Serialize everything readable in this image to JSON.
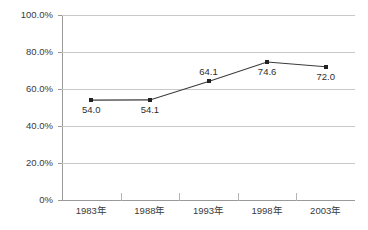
{
  "chart_data": {
    "type": "line",
    "title": "",
    "subtitle": "",
    "xlabel": "",
    "ylabel": "",
    "categories": [
      "1983年",
      "1988年",
      "1993年",
      "1998年",
      "2003年"
    ],
    "values": [
      54.0,
      54.1,
      64.1,
      74.6,
      72.0
    ],
    "value_labels": [
      "54.0",
      "54.1",
      "64.1",
      "74.6",
      "72.0"
    ],
    "label_positions": [
      "below",
      "below",
      "above",
      "below",
      "below"
    ],
    "ylim": [
      0,
      100
    ],
    "ytick_values": [
      100,
      80,
      60,
      40,
      20,
      0
    ],
    "ytick_labels": [
      "100.0%",
      "80.0%",
      "60.0%",
      "40.0%",
      "20.0%",
      "0%"
    ],
    "grid": true,
    "legend": "none",
    "series_color": "#3b3b3b",
    "marker_color": "#222222",
    "gridline_color": "#c9c9c9",
    "axis_color": "#9a9a9a",
    "background": "#ffffff"
  }
}
